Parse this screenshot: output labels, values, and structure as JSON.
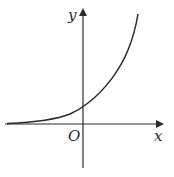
{
  "figure": {
    "type": "function-graph",
    "labels": {
      "y_axis": "y",
      "x_axis": "x",
      "origin": "O"
    },
    "colors": {
      "axis": "#2a2a2a",
      "curve": "#2a2a2a",
      "background": "#ffffff"
    }
  }
}
